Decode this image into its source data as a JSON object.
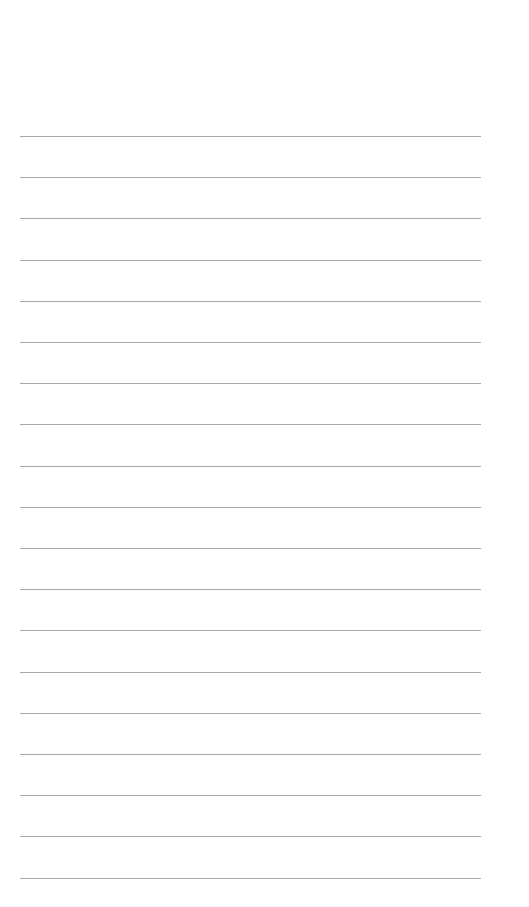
{
  "page": {
    "type": "lined-paper",
    "line_count": 19,
    "first_line_y": 136,
    "line_spacing": 41.2,
    "line_left": 20,
    "line_width": 461,
    "line_color": "#a9a9a9",
    "background": "#ffffff"
  }
}
